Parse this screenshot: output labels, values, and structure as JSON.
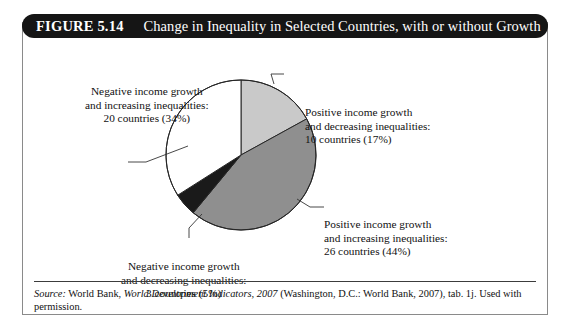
{
  "figure": {
    "number": "FIGURE 5.14",
    "title": "Change in Inequality in Selected Countries, with or without Growth"
  },
  "colors": {
    "header_background": "#151515",
    "frame_border": "#8a8a8a",
    "slice_light_gray": "#c9c9c9",
    "slice_medium_gray": "#8f8f8f",
    "slice_black": "#1a1a1a",
    "slice_white": "#ffffff",
    "outline": "#262626",
    "leader_line": "#333333",
    "text": "#111111"
  },
  "labels": {
    "neg_inc": {
      "line1": "Negative income growth",
      "line2": "and increasing inequalities:",
      "line3": "20 countries (34%)"
    },
    "pos_dec": {
      "line1": "Positive income growth",
      "line2": "and decreasing inequalities:",
      "line3": "10 countries (17%)"
    },
    "pos_inc": {
      "line1": "Positive income growth",
      "line2": "and increasing inequalities:",
      "line3": "26 countries (44%)"
    },
    "neg_dec": {
      "line1": "Negative income growth",
      "line2": "and decreasing inequalities:",
      "line3": "3 countries (5%)"
    }
  },
  "source": {
    "label": "Source:",
    "text_before_italic": " World Bank, ",
    "italic_title": "World Development Indicators, 2007",
    "text_after_italic": " (Washington, D.C.: World Bank, 2007), tab. 1j. Used with permission."
  },
  "chart_data": {
    "type": "pie",
    "title": "Change in Inequality in Selected Countries, with or without Growth",
    "categories": [
      "Positive income growth and decreasing inequalities",
      "Positive income growth and increasing inequalities",
      "Negative income growth and decreasing inequalities",
      "Negative income growth and increasing inequalities"
    ],
    "values": [
      17,
      44,
      5,
      34
    ],
    "counts": [
      10,
      26,
      3,
      20
    ],
    "count_unit": "countries",
    "value_unit": "percent",
    "total_countries": 59,
    "slice_colors": [
      "#c9c9c9",
      "#8f8f8f",
      "#1a1a1a",
      "#ffffff"
    ],
    "start_angle_deg": 0,
    "direction": "clockwise",
    "legend": "callout-labels",
    "grid": false
  }
}
